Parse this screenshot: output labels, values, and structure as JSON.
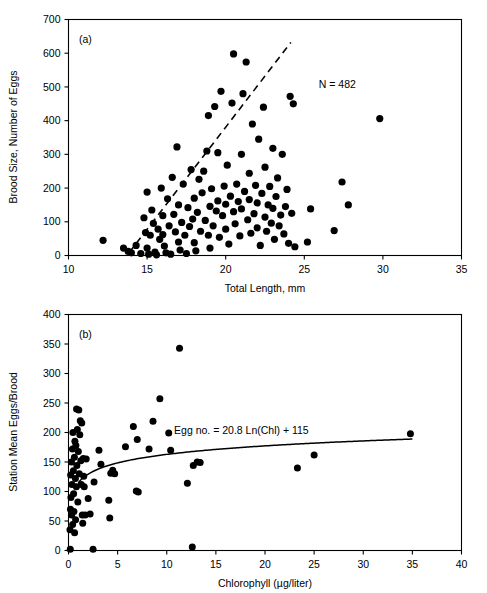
{
  "figure": {
    "background": "#ffffff",
    "ink": "#000000"
  },
  "chart_data": [
    {
      "type": "scatter",
      "panel": "(a)",
      "title": "",
      "xlabel": "Total Length, mm",
      "ylabel": "Brood Size, Number of Eggs",
      "xlim": [
        10,
        35
      ],
      "ylim": [
        0,
        700
      ],
      "xticks": [
        10,
        15,
        20,
        25,
        30,
        35
      ],
      "yticks": [
        0,
        100,
        200,
        300,
        400,
        500,
        600,
        700
      ],
      "grid": false,
      "legend": "none",
      "annotations": [
        {
          "text": "N = 482",
          "x": 27.1,
          "y": 498
        }
      ],
      "trendline": {
        "style": "dashed",
        "label": "",
        "x": [
          13.85,
          24.15
        ],
        "y": [
          8,
          632
        ]
      },
      "n_points_stated": 482,
      "points": [
        [
          12.2,
          45
        ],
        [
          13.5,
          22
        ],
        [
          13.8,
          12
        ],
        [
          14.0,
          8
        ],
        [
          14.3,
          30
        ],
        [
          14.6,
          6
        ],
        [
          14.8,
          112
        ],
        [
          14.9,
          68
        ],
        [
          15.0,
          188
        ],
        [
          15.0,
          22
        ],
        [
          15.1,
          4
        ],
        [
          15.2,
          60
        ],
        [
          15.3,
          135
        ],
        [
          15.4,
          95
        ],
        [
          15.5,
          10
        ],
        [
          15.6,
          2
        ],
        [
          15.7,
          78
        ],
        [
          15.8,
          48
        ],
        [
          15.9,
          200
        ],
        [
          16.0,
          118
        ],
        [
          16.0,
          62
        ],
        [
          16.1,
          28
        ],
        [
          16.2,
          8
        ],
        [
          16.3,
          168
        ],
        [
          16.4,
          88
        ],
        [
          16.5,
          4
        ],
        [
          16.6,
          232
        ],
        [
          16.7,
          122
        ],
        [
          16.8,
          70
        ],
        [
          16.9,
          322
        ],
        [
          17.0,
          150
        ],
        [
          17.0,
          40
        ],
        [
          17.1,
          16
        ],
        [
          17.2,
          98
        ],
        [
          17.3,
          212
        ],
        [
          17.4,
          60
        ],
        [
          17.5,
          6
        ],
        [
          17.6,
          142
        ],
        [
          17.7,
          86
        ],
        [
          17.8,
          255
        ],
        [
          17.9,
          108
        ],
        [
          18.0,
          38
        ],
        [
          18.0,
          170
        ],
        [
          18.1,
          14
        ],
        [
          18.2,
          128
        ],
        [
          18.3,
          226
        ],
        [
          18.4,
          72
        ],
        [
          18.5,
          186
        ],
        [
          18.6,
          250
        ],
        [
          18.7,
          104
        ],
        [
          18.8,
          310
        ],
        [
          18.9,
          60
        ],
        [
          18.9,
          415
        ],
        [
          19.0,
          146
        ],
        [
          19.0,
          22
        ],
        [
          19.1,
          198
        ],
        [
          19.2,
          88
        ],
        [
          19.3,
          442
        ],
        [
          19.4,
          132
        ],
        [
          19.5,
          305
        ],
        [
          19.5,
          162
        ],
        [
          19.6,
          54
        ],
        [
          19.7,
          487
        ],
        [
          19.8,
          118
        ],
        [
          19.9,
          206
        ],
        [
          20.0,
          152
        ],
        [
          20.0,
          78
        ],
        [
          20.1,
          268
        ],
        [
          20.2,
          34
        ],
        [
          20.3,
          176
        ],
        [
          20.4,
          452
        ],
        [
          20.5,
          130
        ],
        [
          20.5,
          598
        ],
        [
          20.6,
          94
        ],
        [
          20.7,
          212
        ],
        [
          20.8,
          160
        ],
        [
          20.9,
          58
        ],
        [
          21.0,
          300
        ],
        [
          21.0,
          138
        ],
        [
          21.1,
          480
        ],
        [
          21.2,
          190
        ],
        [
          21.3,
          574
        ],
        [
          21.4,
          106
        ],
        [
          21.5,
          244
        ],
        [
          21.5,
          166
        ],
        [
          21.6,
          66
        ],
        [
          21.7,
          390
        ],
        [
          21.8,
          124
        ],
        [
          21.9,
          208
        ],
        [
          22.0,
          156
        ],
        [
          22.0,
          82
        ],
        [
          22.1,
          345
        ],
        [
          22.2,
          30
        ],
        [
          22.3,
          184
        ],
        [
          22.4,
          440
        ],
        [
          22.5,
          114
        ],
        [
          22.5,
          262
        ],
        [
          22.6,
          72
        ],
        [
          22.7,
          150
        ],
        [
          22.8,
          205
        ],
        [
          22.9,
          96
        ],
        [
          23.0,
          318
        ],
        [
          23.0,
          140
        ],
        [
          23.1,
          48
        ],
        [
          23.2,
          175
        ],
        [
          23.3,
          230
        ],
        [
          23.4,
          88
        ],
        [
          23.5,
          120
        ],
        [
          23.6,
          300
        ],
        [
          23.7,
          64
        ],
        [
          23.8,
          145
        ],
        [
          23.9,
          196
        ],
        [
          24.0,
          36
        ],
        [
          24.1,
          472
        ],
        [
          24.2,
          125
        ],
        [
          24.3,
          450
        ],
        [
          24.4,
          26
        ],
        [
          25.2,
          40
        ],
        [
          25.4,
          138
        ],
        [
          26.9,
          74
        ],
        [
          27.4,
          218
        ],
        [
          27.8,
          150
        ],
        [
          29.8,
          406
        ]
      ],
      "cluster_note": "dense overlapping cloud, 482 broods total"
    },
    {
      "type": "scatter",
      "panel": "(b)",
      "title": "",
      "xlabel": "Chlorophyll (µg/liter)",
      "ylabel": "Station Mean Eggs/Brood",
      "xlim": [
        0,
        40
      ],
      "ylim": [
        0,
        400
      ],
      "xticks": [
        0,
        5,
        10,
        15,
        20,
        25,
        30,
        35,
        40
      ],
      "yticks": [
        0,
        50,
        100,
        150,
        200,
        250,
        300,
        350,
        400
      ],
      "grid": false,
      "legend": "none",
      "annotations": [
        {
          "text": "Egg no. = 20.8 Ln(Chl) + 115",
          "x": 17.6,
          "y": 197
        }
      ],
      "fit_curve": {
        "style": "solid",
        "equation": "Egg no. = 20.8 Ln(Chl) + 115",
        "slope": 20.8,
        "intercept": 115,
        "form": "y = 20.8*ln(x) + 115",
        "x_range": [
          1.0,
          35.0
        ]
      },
      "points": [
        [
          0.15,
          35
        ],
        [
          0.18,
          2
        ],
        [
          0.2,
          70
        ],
        [
          0.22,
          128
        ],
        [
          0.25,
          90
        ],
        [
          0.3,
          150
        ],
        [
          0.32,
          60
        ],
        [
          0.35,
          112
        ],
        [
          0.4,
          172
        ],
        [
          0.42,
          44
        ],
        [
          0.45,
          200
        ],
        [
          0.5,
          135
        ],
        [
          0.52,
          96
        ],
        [
          0.55,
          66
        ],
        [
          0.6,
          158
        ],
        [
          0.62,
          30
        ],
        [
          0.65,
          185
        ],
        [
          0.7,
          122
        ],
        [
          0.72,
          52
        ],
        [
          0.75,
          178
        ],
        [
          0.8,
          108
        ],
        [
          0.82,
          240
        ],
        [
          0.85,
          144
        ],
        [
          0.9,
          205
        ],
        [
          0.95,
          82
        ],
        [
          1.0,
          168
        ],
        [
          1.05,
          238
        ],
        [
          1.1,
          130
        ],
        [
          1.15,
          196
        ],
        [
          1.2,
          220
        ],
        [
          1.25,
          152
        ],
        [
          1.3,
          112
        ],
        [
          1.35,
          216
        ],
        [
          1.4,
          60
        ],
        [
          1.45,
          46
        ],
        [
          1.5,
          156
        ],
        [
          1.55,
          126
        ],
        [
          1.6,
          108
        ],
        [
          1.7,
          60
        ],
        [
          1.8,
          155
        ],
        [
          2.0,
          88
        ],
        [
          2.2,
          62
        ],
        [
          2.5,
          2
        ],
        [
          2.6,
          116
        ],
        [
          3.1,
          170
        ],
        [
          3.3,
          146
        ],
        [
          4.1,
          85
        ],
        [
          4.2,
          55
        ],
        [
          4.3,
          131
        ],
        [
          4.5,
          136
        ],
        [
          4.7,
          130
        ],
        [
          5.8,
          176
        ],
        [
          6.6,
          210
        ],
        [
          6.9,
          101
        ],
        [
          7.1,
          99
        ],
        [
          7.0,
          188
        ],
        [
          8.2,
          172
        ],
        [
          8.6,
          219
        ],
        [
          9.3,
          257
        ],
        [
          10.2,
          199
        ],
        [
          10.4,
          170
        ],
        [
          11.3,
          343
        ],
        [
          12.1,
          114
        ],
        [
          12.6,
          6
        ],
        [
          12.7,
          144
        ],
        [
          13.1,
          150
        ],
        [
          13.4,
          149
        ],
        [
          23.3,
          140
        ],
        [
          25.0,
          162
        ],
        [
          34.8,
          198
        ]
      ]
    }
  ],
  "panel_a": {
    "tag": "(a)",
    "xlabel": "Total Length, mm",
    "ylabel": "Brood Size, Number of Eggs",
    "annotation": "N = 482",
    "xticks": [
      "10",
      "15",
      "20",
      "25",
      "30",
      "35"
    ],
    "yticks": [
      "0",
      "100",
      "200",
      "300",
      "400",
      "500",
      "600",
      "700"
    ]
  },
  "panel_b": {
    "tag": "(b)",
    "xlabel": "Chlorophyll (µg/liter)",
    "ylabel": "Station Mean Eggs/Brood",
    "annotation": "Egg no. = 20.8 Ln(Chl) + 115",
    "xticks": [
      "0",
      "5",
      "10",
      "15",
      "20",
      "25",
      "30",
      "35",
      "40"
    ],
    "yticks": [
      "0",
      "50",
      "100",
      "150",
      "200",
      "250",
      "300",
      "350",
      "400"
    ]
  }
}
